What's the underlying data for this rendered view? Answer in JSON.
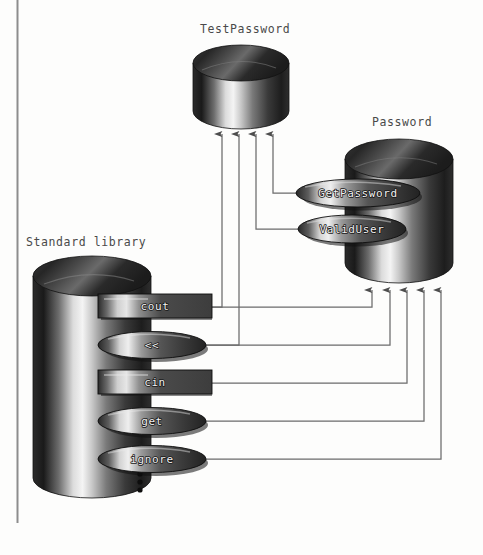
{
  "diagram": {
    "title_bar_visible": true,
    "background_color": "#fdfdfc",
    "line_color": "#6b6b6b",
    "label_color": "#4a4a4a",
    "components": [
      {
        "id": "testpassword",
        "label": "TestPassword",
        "shape": "cylinder",
        "x": 193,
        "y": 45,
        "width": 96,
        "height": 84,
        "incoming_arrows": 4
      },
      {
        "id": "password",
        "label": "Password",
        "shape": "cylinder",
        "x": 345,
        "y": 137,
        "width": 108,
        "height": 148,
        "incoming_arrows": 5,
        "interfaces": [
          {
            "name": "GetPassword",
            "shape": "ellipse",
            "cx": 358,
            "cy": 193,
            "rx": 62,
            "ry": 14
          },
          {
            "name": "ValidUser",
            "shape": "ellipse",
            "cx": 352,
            "cy": 229,
            "rx": 54,
            "ry": 14
          }
        ]
      },
      {
        "id": "standard-library",
        "label": "Standard library",
        "shape": "cylinder",
        "x": 33,
        "y": 256,
        "width": 118,
        "height": 242,
        "ellipsis_marker": "•••",
        "interfaces": [
          {
            "name": "cout",
            "shape": "rect",
            "cx": 155,
            "cy": 307,
            "rx": 57,
            "ry": 13
          },
          {
            "name": "<<",
            "shape": "ellipse",
            "cx": 152,
            "cy": 345,
            "rx": 54,
            "ry": 13
          },
          {
            "name": "cin",
            "shape": "rect",
            "cx": 155,
            "cy": 383,
            "rx": 57,
            "ry": 13
          },
          {
            "name": "get",
            "shape": "ellipse",
            "cx": 152,
            "cy": 421,
            "rx": 54,
            "ry": 13
          },
          {
            "name": "ignore",
            "shape": "ellipse",
            "cx": 152,
            "cy": 459,
            "rx": 54,
            "ry": 13
          }
        ]
      }
    ],
    "connections": [
      {
        "from": "cout",
        "to": "testpassword",
        "arrow_x": 222,
        "from_y": 307,
        "turn_x": 222
      },
      {
        "from": "<<",
        "to": "testpassword",
        "arrow_x": 239,
        "from_y": 345,
        "turn_x": 239
      },
      {
        "from": "ValidUser",
        "to": "testpassword",
        "arrow_x": 256,
        "from_y": 229,
        "turn_x": 256
      },
      {
        "from": "GetPassword",
        "to": "testpassword",
        "arrow_x": 273,
        "from_y": 193,
        "turn_x": 273
      },
      {
        "from": "cout",
        "to": "password",
        "arrow_x": 372,
        "from_y": 307,
        "turn_x": 372
      },
      {
        "from": "<<",
        "to": "password",
        "arrow_x": 390,
        "from_y": 345,
        "turn_x": 390
      },
      {
        "from": "cin",
        "to": "password",
        "arrow_x": 407,
        "from_y": 383,
        "turn_x": 407
      },
      {
        "from": "get",
        "to": "password",
        "arrow_x": 424,
        "from_y": 421,
        "turn_x": 424
      },
      {
        "from": "ignore",
        "to": "password",
        "arrow_x": 441,
        "from_y": 459,
        "turn_x": 441
      }
    ],
    "page_rule": {
      "x": 17,
      "y_top": 0,
      "y_bottom": 523
    }
  }
}
